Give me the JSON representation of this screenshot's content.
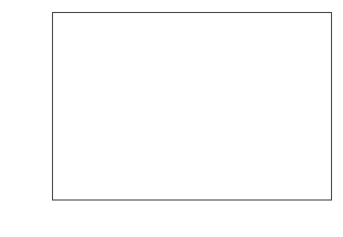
{
  "figure": {
    "background_color": "#ffffff",
    "frame_color": "#4a4a4a",
    "marker_color": "#000000"
  },
  "axes": {
    "x": {
      "title_prefix": "Wavelength ",
      "title_symbol": "λ",
      "title_unit": " [nm]",
      "title_full": "Wavelength λ [nm]",
      "major_ticks": [
        "0.1",
        "0.2",
        "0.3",
        "0.4",
        "0.5"
      ],
      "major_tick_values": [
        0.1,
        0.2,
        0.3,
        0.4,
        0.5
      ],
      "minor_tick_step": 0.02,
      "range": [
        0.0,
        0.5549
      ]
    },
    "y": {
      "title_text": "Number of neutrons [min",
      "title_sup1": "−1",
      "title_mu": "μA",
      "title_sup2": "−1",
      "title_close": "]",
      "title_full": "Number of neutrons [min−1μA−1]",
      "major_ticks": [
        "0",
        "2",
        "4",
        "6",
        "8",
        "10"
      ],
      "major_tick_values": [
        0,
        2,
        4,
        6,
        8,
        10
      ],
      "minor_tick_step": 0.5,
      "range": [
        0.0,
        11.12
      ]
    }
  },
  "chart_data": {
    "type": "scatter",
    "title": "",
    "xlabel": "Wavelength λ [nm]",
    "ylabel": "Number of neutrons [min−1μA−1]",
    "xlim": [
      0.0,
      0.5549
    ],
    "ylim": [
      0.0,
      11.12
    ],
    "grid": false,
    "legend": false,
    "marker": "filled-circle",
    "marker_size_px": 3.1,
    "series_name": "Neutron wavelength spectrum",
    "x": [
      0.052,
      0.056,
      0.06,
      0.063,
      0.066,
      0.07,
      0.074,
      0.078,
      0.082,
      0.086,
      0.09,
      0.094,
      0.098,
      0.102,
      0.106,
      0.11,
      0.114,
      0.118,
      0.122,
      0.126,
      0.13,
      0.134,
      0.138,
      0.142,
      0.146,
      0.15,
      0.154,
      0.158,
      0.162,
      0.166,
      0.17,
      0.174,
      0.178,
      0.182,
      0.186,
      0.19,
      0.194,
      0.198,
      0.202,
      0.206,
      0.21,
      0.214,
      0.218,
      0.222,
      0.226,
      0.23,
      0.234,
      0.238,
      0.242,
      0.246,
      0.25,
      0.254,
      0.258,
      0.262,
      0.266,
      0.27,
      0.274,
      0.278,
      0.282,
      0.286,
      0.29,
      0.294,
      0.298,
      0.302,
      0.306,
      0.31,
      0.314,
      0.318,
      0.322,
      0.326,
      0.33,
      0.334,
      0.338,
      0.342,
      0.346,
      0.35,
      0.354,
      0.358,
      0.362,
      0.366,
      0.37,
      0.374,
      0.378,
      0.382,
      0.386,
      0.39,
      0.394,
      0.398,
      0.402,
      0.406,
      0.41,
      0.414,
      0.418,
      0.422,
      0.426,
      0.43,
      0.434,
      0.438,
      0.442,
      0.446,
      0.45,
      0.454,
      0.458,
      0.462,
      0.466,
      0.47,
      0.474,
      0.478,
      0.482,
      0.486,
      0.49,
      0.494,
      0.498,
      0.502,
      0.506,
      0.51,
      0.514,
      0.518,
      0.522,
      0.526,
      0.53,
      0.534,
      0.538
    ],
    "y": [
      2.92,
      2.78,
      2.86,
      2.8,
      2.88,
      2.98,
      3.48,
      4.18,
      5.02,
      5.98,
      6.88,
      7.72,
      9.08,
      9.48,
      9.82,
      10.18,
      10.22,
      10.28,
      10.12,
      10.2,
      9.62,
      9.22,
      8.12,
      8.28,
      7.42,
      6.9,
      6.38,
      5.92,
      5.5,
      5.02,
      4.72,
      4.58,
      4.02,
      3.88,
      3.68,
      3.42,
      3.08,
      2.88,
      2.7,
      2.52,
      2.34,
      2.18,
      2.04,
      1.9,
      1.78,
      1.66,
      1.54,
      1.44,
      1.34,
      1.26,
      1.18,
      1.1,
      1.03,
      0.96,
      0.9,
      0.84,
      0.79,
      0.74,
      0.69,
      0.65,
      0.61,
      0.57,
      0.535,
      0.5,
      0.47,
      0.44,
      0.415,
      0.39,
      0.365,
      0.345,
      0.325,
      0.305,
      0.288,
      0.271,
      0.256,
      0.241,
      0.228,
      0.215,
      0.203,
      0.192,
      0.182,
      0.172,
      0.163,
      0.154,
      0.146,
      0.139,
      0.132,
      0.125,
      0.119,
      0.113,
      0.108,
      0.103,
      0.098,
      0.093,
      0.089,
      0.085,
      0.081,
      0.077,
      0.074,
      0.071,
      0.068,
      0.065,
      0.062,
      0.06,
      0.057,
      0.055,
      0.053,
      0.051,
      0.049,
      0.047,
      0.045,
      0.044,
      0.042,
      0.041,
      0.039,
      0.038,
      0.037,
      0.036,
      0.035,
      0.034,
      0.033,
      0.032,
      0.031
    ],
    "annotations": {
      "peak_value": 10.28,
      "peak_wavelength": 0.118,
      "low_plateau_value": 2.86,
      "n_points": 123
    }
  }
}
